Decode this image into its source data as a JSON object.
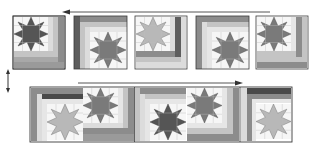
{
  "diagram": {
    "colors": {
      "background": "#ffffff",
      "outline": "#3a3a3a",
      "star_dark": "#555555",
      "star_medium": "#7a7a7a",
      "star_light": "#b8b8b8",
      "star_bg": "#f6f6f6",
      "strip_dark": "#5e5e5e",
      "strip_medium": "#8c8c8c",
      "strip_light": "#c4c4c4",
      "strip_pale": "#dcdcdc",
      "arrow": "#444444"
    },
    "arrows": [
      {
        "name": "top-row-direction-arrow",
        "direction": "left"
      },
      {
        "name": "row-flip-arrow",
        "direction": "vertical-both"
      },
      {
        "name": "bottom-row-direction-arrow",
        "direction": "right"
      }
    ],
    "top_row": {
      "blocks": [
        {
          "id": 1,
          "star": "dark",
          "borders": "right-bottom"
        },
        {
          "id": 2,
          "star": "medium",
          "borders": "left-top"
        },
        {
          "id": 3,
          "star": "light",
          "borders": "right-bottom"
        },
        {
          "id": 4,
          "star": "medium",
          "borders": "left-top"
        },
        {
          "id": 5,
          "star": "medium",
          "borders": "right-bottom"
        }
      ]
    },
    "bottom_row": {
      "blocks": [
        {
          "id": 1,
          "star": "light",
          "borders": "left-top"
        },
        {
          "id": 2,
          "star": "medium",
          "borders": "right-bottom"
        },
        {
          "id": 3,
          "star": "dark",
          "borders": "left-top"
        },
        {
          "id": 4,
          "star": "medium",
          "borders": "right-bottom"
        },
        {
          "id": 5,
          "star": "light",
          "borders": "left-top"
        }
      ]
    }
  }
}
